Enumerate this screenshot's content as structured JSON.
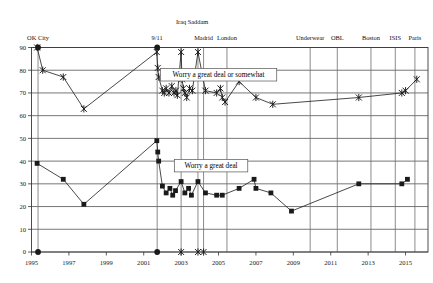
{
  "chart_data": {
    "type": "line",
    "title": "",
    "xlabel": "",
    "ylabel": "",
    "xlim": [
      1995,
      2016.2
    ],
    "ylim": [
      0,
      90
    ],
    "grid": true,
    "y_ticks": [
      0,
      10,
      20,
      30,
      40,
      50,
      60,
      70,
      80,
      90
    ],
    "x_ticks": [
      1995,
      1997,
      1999,
      2001,
      2003,
      2005,
      2007,
      2009,
      2011,
      2013,
      2015
    ],
    "y_tick_labels": [
      "0",
      "10",
      "20",
      "30",
      "40",
      "50",
      "60",
      "70",
      "80",
      "90"
    ],
    "x_tick_labels": [
      "1995",
      "1997",
      "1999",
      "2001",
      "2003",
      "2005",
      "2007",
      "2009",
      "2011",
      "2013",
      "2015"
    ],
    "legend_position": "inline-boxed",
    "series": [
      {
        "name": "Worry a great deal or somewhat",
        "marker": "x",
        "label_x": 2005.0,
        "label_y": 78.0,
        "points": [
          [
            1995.3,
            90
          ],
          [
            1995.6,
            80
          ],
          [
            1996.7,
            77
          ],
          [
            1997.8,
            63
          ],
          [
            2001.7,
            88
          ],
          [
            2001.75,
            81
          ],
          [
            2001.8,
            77
          ],
          [
            2002.0,
            71
          ],
          [
            2002.1,
            70
          ],
          [
            2002.2,
            72
          ],
          [
            2002.35,
            70
          ],
          [
            2002.5,
            73
          ],
          [
            2002.62,
            70
          ],
          [
            2002.72,
            71
          ],
          [
            2002.8,
            69
          ],
          [
            2003.0,
            88
          ],
          [
            2003.05,
            76
          ],
          [
            2003.12,
            72
          ],
          [
            2003.2,
            70
          ],
          [
            2003.3,
            68
          ],
          [
            2003.45,
            72
          ],
          [
            2003.6,
            71
          ],
          [
            2003.9,
            88
          ],
          [
            2004.3,
            71
          ],
          [
            2004.9,
            70
          ],
          [
            2005.1,
            72
          ],
          [
            2005.2,
            68
          ],
          [
            2005.35,
            66
          ],
          [
            2006.1,
            75
          ],
          [
            2007.0,
            68
          ],
          [
            2007.9,
            65
          ],
          [
            2012.5,
            68
          ],
          [
            2014.8,
            70
          ],
          [
            2015.0,
            71
          ],
          [
            2015.6,
            76
          ]
        ]
      },
      {
        "name": "Worry a great deal",
        "marker": "square",
        "label_x": 2004.6,
        "label_y": 38.0,
        "points": [
          [
            1995.3,
            39
          ],
          [
            1996.7,
            32
          ],
          [
            1997.8,
            21
          ],
          [
            2001.7,
            49
          ],
          [
            2001.75,
            44
          ],
          [
            2001.8,
            40
          ],
          [
            2002.0,
            29
          ],
          [
            2002.2,
            26
          ],
          [
            2002.4,
            28
          ],
          [
            2002.55,
            25
          ],
          [
            2002.7,
            27
          ],
          [
            2003.0,
            31
          ],
          [
            2003.2,
            26
          ],
          [
            2003.4,
            28
          ],
          [
            2003.55,
            25
          ],
          [
            2003.9,
            31
          ],
          [
            2004.3,
            26
          ],
          [
            2004.9,
            25
          ],
          [
            2005.2,
            25
          ],
          [
            2006.1,
            28
          ],
          [
            2006.9,
            32
          ],
          [
            2007.0,
            28
          ],
          [
            2007.8,
            26
          ],
          [
            2008.9,
            18
          ],
          [
            2012.5,
            30
          ],
          [
            2014.8,
            30
          ],
          [
            2015.1,
            32
          ]
        ]
      }
    ],
    "annotations": [
      {
        "label": "OK City",
        "x": 1995.35,
        "row": 1
      },
      {
        "label": "9/11",
        "x": 2001.72,
        "row": 1
      },
      {
        "label": "Iraq",
        "x": 2003.0,
        "row": 0
      },
      {
        "label": "Saddam",
        "x": 2003.9,
        "row": 0
      },
      {
        "label": "Madrid",
        "x": 2004.2,
        "row": 1
      },
      {
        "label": "London",
        "x": 2005.45,
        "row": 1
      },
      {
        "label": "Underwear",
        "x": 2009.9,
        "row": 1
      },
      {
        "label": "OBL",
        "x": 2011.35,
        "row": 1
      },
      {
        "label": "Boston",
        "x": 2013.15,
        "row": 1
      },
      {
        "label": "ISIS",
        "x": 2014.45,
        "row": 1
      },
      {
        "label": "Paris",
        "x": 2015.5,
        "row": 1
      }
    ],
    "event_lines": [
      1995.35,
      2001.72,
      2003.0,
      2003.9,
      2004.2,
      2005.45,
      2009.9,
      2011.35,
      2013.15,
      2014.45,
      2015.5
    ],
    "baseline_markers": [
      {
        "x": 1995.35,
        "marker": "dot"
      },
      {
        "x": 2001.72,
        "marker": "dot"
      },
      {
        "x": 2003.0,
        "marker": "x"
      },
      {
        "x": 2003.9,
        "marker": "x"
      },
      {
        "x": 2004.2,
        "marker": "x"
      }
    ],
    "colors": {
      "line": "#1a1a1a",
      "grid": "#4a4a4a",
      "event_line": "#6e6e6e",
      "frame": "#3a3a3a",
      "background": "#ffffff"
    }
  }
}
